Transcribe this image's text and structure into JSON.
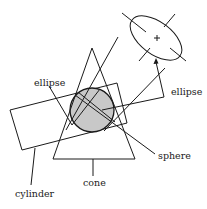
{
  "diagram": {
    "type": "geometric-primitives-illustration",
    "labels": {
      "ellipse_left": "ellipse",
      "ellipse_right": "ellipse",
      "sphere": "sphere",
      "cone": "cone",
      "cylinder": "cylinder"
    },
    "colors": {
      "stroke": "#1a1a1a",
      "sphere_fill": "#c8c8c8",
      "background": "#ffffff"
    },
    "shapes": [
      "ellipse-with-crosshair",
      "cone",
      "cylinder",
      "sphere"
    ]
  }
}
